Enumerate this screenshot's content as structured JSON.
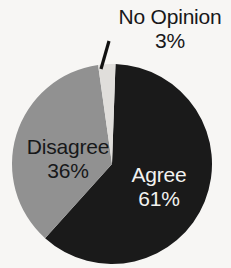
{
  "chart_data": {
    "type": "pie",
    "title": "",
    "subtitle": "",
    "xlabel": "",
    "ylabel": "",
    "legend_position": "none",
    "grid": false,
    "labels_inside": true,
    "total_percent": 100,
    "slices": [
      {
        "name": "Agree",
        "label": "Agree",
        "value": 61,
        "value_text": "61%",
        "color": "#1a1a1a",
        "text_color": "#f2f2f0",
        "start_angle_deg": 2,
        "end_angle_deg": 222,
        "label_placement": "inside"
      },
      {
        "name": "Disagree",
        "label": "Disagree",
        "value": 36,
        "value_text": "36%",
        "color": "#919191",
        "text_color": "#17181a",
        "start_angle_deg": 222,
        "end_angle_deg": 352,
        "label_placement": "inside"
      },
      {
        "name": "No Opinion",
        "label": "No Opinion",
        "value": 3,
        "value_text": "3%",
        "color": "#e0dedb",
        "text_color": "#17181a",
        "start_angle_deg": 352,
        "end_angle_deg": 362,
        "label_placement": "outside-callout"
      }
    ]
  },
  "geometry": {
    "center_x": 112,
    "center_y": 164,
    "radius": 100,
    "leader_x1": 101,
    "leader_y1": 69,
    "leader_x2": 109,
    "leader_y2": 41
  },
  "colors": {
    "background": "#f7f6f4",
    "agree": "#1a1a1a",
    "disagree": "#919191",
    "no_opinion": "#e0dedb",
    "label_dark": "#17181a",
    "label_light": "#f2f2f0",
    "leader": "#111111"
  }
}
